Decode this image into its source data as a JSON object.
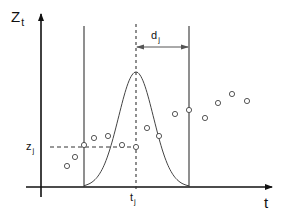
{
  "diagram": {
    "title": "",
    "colors": {
      "background": "#ffffff",
      "axis": "#111111",
      "window_line": "#333333",
      "dashed": "#333333",
      "curve": "#444444",
      "points": "#444444"
    },
    "labels": {
      "y_axis": {
        "main": "Z",
        "sub": "t"
      },
      "x_axis": {
        "main": "t",
        "sub": ""
      },
      "z_j": {
        "main": "z",
        "sub": "j"
      },
      "t_j": {
        "main": "t",
        "sub": "j"
      },
      "d_j": {
        "main": "d",
        "sub": "j"
      }
    },
    "axes": {
      "origin": [
        41,
        187
      ],
      "y_axis": {
        "x": 41,
        "y_top": 14,
        "y_bottom": 197
      },
      "x_axis": {
        "y": 187,
        "x_left": 26,
        "x_right": 272
      }
    },
    "window": {
      "left_x": 84,
      "right_x": 189,
      "top_y": 26,
      "center_x": 136,
      "center_top_y": 24,
      "center_bottom_y": 190
    },
    "bandwidth_arrow": {
      "y": 47,
      "x_start": 136,
      "x_end": 189
    },
    "z_j_line": {
      "y": 147,
      "x_start": 50,
      "x_end": 136
    },
    "kernel_curve": {
      "peak": [
        136,
        72
      ],
      "base_left": 84,
      "base_right": 189,
      "base_y": 187
    },
    "points": [
      [
        67,
        166
      ],
      [
        75,
        157
      ],
      [
        84,
        145
      ],
      [
        94,
        138
      ],
      [
        108,
        136
      ],
      [
        122,
        145
      ],
      [
        136,
        147
      ],
      [
        147,
        128
      ],
      [
        159,
        136
      ],
      [
        175,
        114
      ],
      [
        189,
        110
      ],
      [
        205,
        118
      ],
      [
        218,
        103
      ],
      [
        232,
        94
      ],
      [
        247,
        101
      ]
    ]
  }
}
